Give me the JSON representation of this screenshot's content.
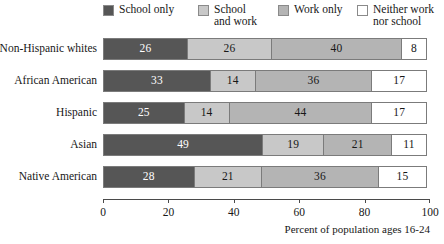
{
  "chart_data": {
    "type": "bar",
    "orientation": "horizontal",
    "stacked": true,
    "normalized": true,
    "title": "",
    "xlabel": "Percent of population ages 16-24",
    "ylabel": "",
    "xlim": [
      0,
      100
    ],
    "xticks": [
      0,
      20,
      40,
      60,
      80,
      100
    ],
    "grid": false,
    "legend_position": "top",
    "categories": [
      "Non-Hispanic whites",
      "African American",
      "Hispanic",
      "Asian",
      "Native American"
    ],
    "series": [
      {
        "name": "School only",
        "color": "#565656",
        "label_color": "#ffffff",
        "values": [
          26,
          33,
          25,
          49,
          28
        ]
      },
      {
        "name": "School\nand work",
        "color": "#c8c8c8",
        "label_color": "#171717",
        "values": [
          26,
          14,
          14,
          19,
          21
        ]
      },
      {
        "name": "Work only",
        "color": "#b4b4b4",
        "label_color": "#171717",
        "values": [
          40,
          36,
          44,
          21,
          36
        ]
      },
      {
        "name": "Neither work\nnor school",
        "color": "#ffffff",
        "label_color": "#171717",
        "values": [
          8,
          17,
          17,
          11,
          15
        ]
      }
    ]
  },
  "legend": {
    "items": [
      {
        "label": "School only"
      },
      {
        "label": "School\nand work"
      },
      {
        "label": "Work only"
      },
      {
        "label": "Neither work\nnor school"
      }
    ]
  },
  "axis": {
    "caption": "Percent of population ages 16-24",
    "tick_labels": [
      "0",
      "20",
      "40",
      "60",
      "80",
      "100"
    ]
  },
  "rows": [
    {
      "label": "Non-Hispanic whites",
      "values": [
        "26",
        "26",
        "40",
        "8"
      ]
    },
    {
      "label": "African American",
      "values": [
        "33",
        "14",
        "36",
        "17"
      ]
    },
    {
      "label": "Hispanic",
      "values": [
        "25",
        "14",
        "44",
        "17"
      ]
    },
    {
      "label": "Asian",
      "values": [
        "49",
        "19",
        "21",
        "11"
      ]
    },
    {
      "label": "Native American",
      "values": [
        "28",
        "21",
        "36",
        "15"
      ]
    }
  ]
}
